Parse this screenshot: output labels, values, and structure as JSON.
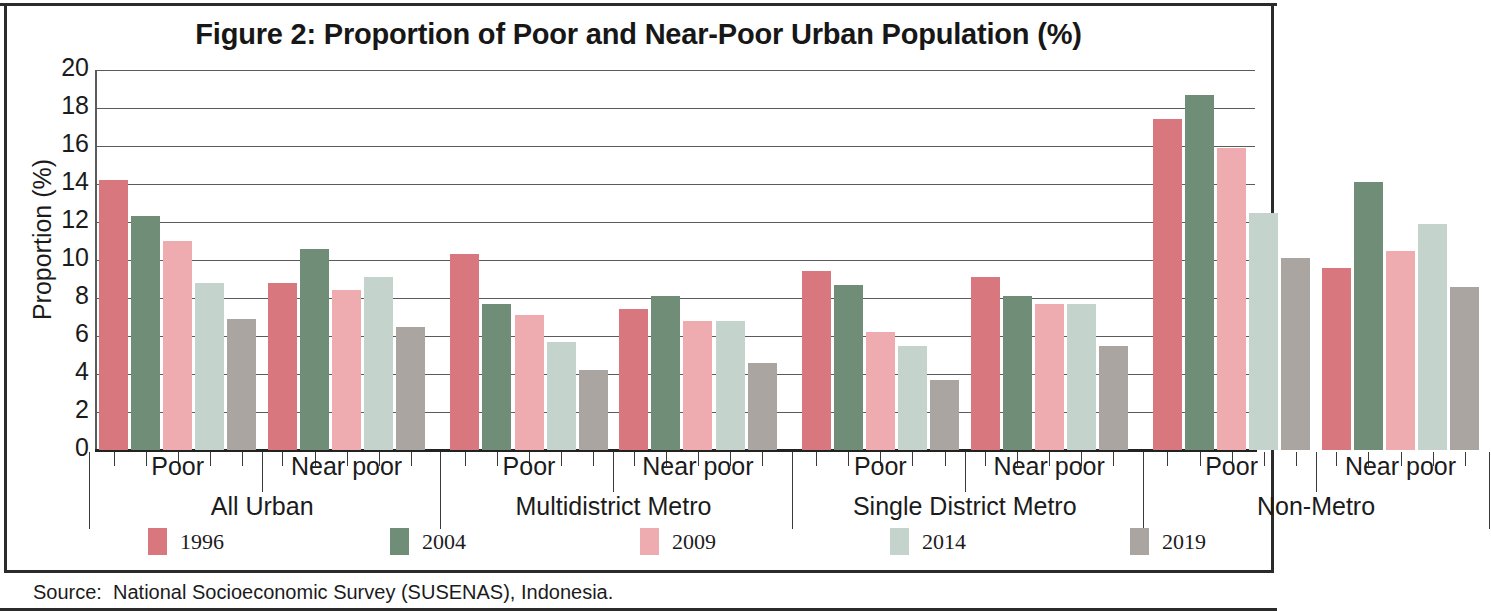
{
  "title": "Figure 2:  Proportion of Poor and Near-Poor Urban Population (%)",
  "source": "Source:  National Socioeconomic Survey (SUSENAS), Indonesia.",
  "axis": {
    "ylabel": "Proportion (%)",
    "yticks": [
      "0",
      "2",
      "4",
      "6",
      "8",
      "10",
      "12",
      "14",
      "16",
      "18",
      "20"
    ]
  },
  "legend": [
    {
      "label": "1996",
      "color": "#d9777e"
    },
    {
      "label": "2004",
      "color": "#6f8d77"
    },
    {
      "label": "2009",
      "color": "#eeabb0"
    },
    {
      "label": "2014",
      "color": "#c4d4cc"
    },
    {
      "label": "2019",
      "color": "#aaa5a1"
    }
  ],
  "groups": [
    {
      "label": "All Urban",
      "subgroups": [
        "Poor",
        "Near poor"
      ]
    },
    {
      "label": "Multidistrict Metro",
      "subgroups": [
        "Poor",
        "Near poor"
      ]
    },
    {
      "label": "Single District Metro",
      "subgroups": [
        "Poor",
        "Near poor"
      ]
    },
    {
      "label": "Non-Metro",
      "subgroups": [
        "Poor",
        "Near poor"
      ]
    }
  ],
  "chart_data": {
    "type": "bar",
    "title": "Figure 2:  Proportion of Poor and Near-Poor Urban Population (%)",
    "xlabel": "",
    "ylabel": "Proportion (%)",
    "ylim": [
      0,
      20
    ],
    "ytick_step": 2,
    "grid": true,
    "legend_position": "bottom",
    "categories": [
      "All Urban - Poor",
      "All Urban - Near poor",
      "Multidistrict Metro - Poor",
      "Multidistrict Metro - Near poor",
      "Single District Metro - Poor",
      "Single District Metro - Near poor",
      "Non-Metro - Poor",
      "Non-Metro - Near poor"
    ],
    "series": [
      {
        "name": "1996",
        "color": "#d9777e",
        "values": [
          14.2,
          8.8,
          10.3,
          7.4,
          9.4,
          9.1,
          17.4,
          9.6
        ]
      },
      {
        "name": "2004",
        "color": "#6f8d77",
        "values": [
          12.3,
          10.6,
          7.7,
          8.1,
          8.7,
          8.1,
          18.7,
          14.1
        ]
      },
      {
        "name": "2009",
        "color": "#eeabb0",
        "values": [
          11.0,
          8.4,
          7.1,
          6.8,
          6.2,
          7.7,
          15.9,
          10.5
        ]
      },
      {
        "name": "2014",
        "color": "#c4d4cc",
        "values": [
          8.8,
          9.1,
          5.7,
          6.8,
          5.5,
          7.7,
          12.5,
          11.9
        ]
      },
      {
        "name": "2019",
        "color": "#aaa5a1",
        "values": [
          6.9,
          6.5,
          4.2,
          4.6,
          3.7,
          5.5,
          10.1,
          8.6
        ]
      }
    ]
  }
}
